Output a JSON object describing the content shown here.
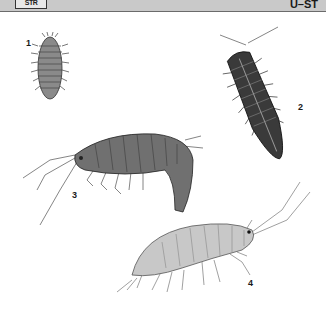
{
  "header": {
    "logo_text": "STR",
    "section_code": "U–ST",
    "bar_color": "#c9c9c9"
  },
  "figures": [
    {
      "number": "1",
      "subject": "woodlouse-dorsal-small",
      "tone": "#8a8a8a"
    },
    {
      "number": "2",
      "subject": "woodlouse-dorsal-dark",
      "tone": "#3a3a3a"
    },
    {
      "number": "3",
      "subject": "amphipod-lateral-dark",
      "tone": "#707070"
    },
    {
      "number": "4",
      "subject": "amphipod-lateral-pale",
      "tone": "#c8c8c8"
    }
  ]
}
